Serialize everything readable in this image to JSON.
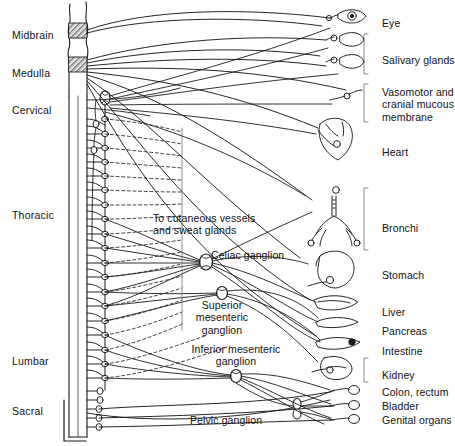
{
  "figure": {
    "background_color": "#ffffff",
    "ink_color": "#1a1a1a"
  },
  "spinal_levels": [
    {
      "id": "midbrain",
      "label": "Midbrain",
      "x": 12,
      "y": 29
    },
    {
      "id": "medulla",
      "label": "Medulla",
      "x": 12,
      "y": 67
    },
    {
      "id": "cervical",
      "label": "Cervical",
      "x": 12,
      "y": 104
    },
    {
      "id": "thoracic",
      "label": "Thoracic",
      "x": 12,
      "y": 209
    },
    {
      "id": "lumbar",
      "label": "Lumbar",
      "x": 12,
      "y": 355
    },
    {
      "id": "sacral",
      "label": "Sacral",
      "x": 12,
      "y": 405
    }
  ],
  "organ_labels": [
    {
      "id": "eye",
      "label": "Eye",
      "x": 382,
      "y": 17
    },
    {
      "id": "salivary-glands",
      "label": "Salivary glands",
      "x": 382,
      "y": 54
    },
    {
      "id": "vasomotor",
      "label": "Vasomotor and\ncranial mucous\nmembrane",
      "x": 382,
      "y": 93
    },
    {
      "id": "heart",
      "label": "Heart",
      "x": 382,
      "y": 146
    },
    {
      "id": "bronchi",
      "label": "Bronchi",
      "x": 382,
      "y": 222
    },
    {
      "id": "stomach",
      "label": "Stomach",
      "x": 382,
      "y": 269
    },
    {
      "id": "liver",
      "label": "Liver",
      "x": 382,
      "y": 306
    },
    {
      "id": "pancreas",
      "label": "Pancreas",
      "x": 382,
      "y": 325
    },
    {
      "id": "intestine",
      "label": "Intestine",
      "x": 382,
      "y": 345
    },
    {
      "id": "kidney",
      "label": "Kidney",
      "x": 382,
      "y": 369
    },
    {
      "id": "colon-rectum",
      "label": "Colon, rectum",
      "x": 382,
      "y": 392
    },
    {
      "id": "bladder",
      "label": "Bladder",
      "x": 382,
      "y": 406
    },
    {
      "id": "genital-organs",
      "label": "Genital organs",
      "x": 382,
      "y": 420
    }
  ],
  "inner_labels": [
    {
      "id": "cutaneous",
      "label": "To cutaneous vessels\nand sweat glands",
      "x": 153,
      "y": 212,
      "align": "left"
    },
    {
      "id": "celiac-ganglion",
      "label": "Celiac ganglion",
      "x": 211,
      "y": 249,
      "align": "left"
    },
    {
      "id": "superior-mesenteric",
      "label": "Superior\nmesenteric\nganglion",
      "x": 222,
      "y": 305,
      "align": "center"
    },
    {
      "id": "inferior-mesenteric",
      "label": "Inferior mesenteric\nganglion",
      "x": 236,
      "y": 348,
      "align": "center"
    },
    {
      "id": "pelvic-ganglion",
      "label": "Pelvic ganglion",
      "x": 190,
      "y": 414,
      "align": "left"
    }
  ],
  "legend_semantics": {
    "solid_line": "preganglionic fiber",
    "dashed_line": "postganglionic fiber",
    "hatched_block": "cranial autonomic nucleus",
    "small_circle": "ganglion"
  }
}
